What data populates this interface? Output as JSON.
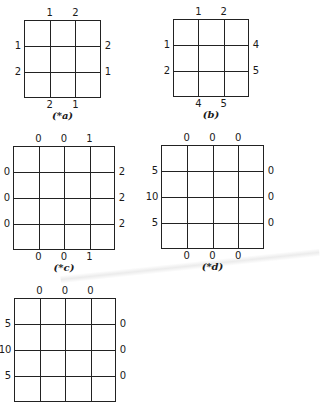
{
  "figures": [
    {
      "id": "a",
      "caption": "(*a)",
      "box": {
        "left": 24,
        "top": 20,
        "width": 77,
        "height": 78
      },
      "cols": 3,
      "rows": 3,
      "top_labels": [
        "1",
        "2"
      ],
      "bottom_labels": [
        "2",
        "1"
      ],
      "left_labels": [
        "1",
        "2"
      ],
      "right_labels": [
        "2",
        "1"
      ]
    },
    {
      "id": "b",
      "caption": "(b)",
      "box": {
        "left": 173,
        "top": 19,
        "width": 76,
        "height": 78
      },
      "cols": 3,
      "rows": 3,
      "top_labels": [
        "1",
        "2"
      ],
      "bottom_labels": [
        "4",
        "5"
      ],
      "left_labels": [
        "1",
        "2"
      ],
      "right_labels": [
        "4",
        "5"
      ]
    },
    {
      "id": "c",
      "caption": "(*c)",
      "box": {
        "left": 13,
        "top": 146,
        "width": 102,
        "height": 104
      },
      "cols": 4,
      "rows": 4,
      "top_labels": [
        "0",
        "0",
        "1"
      ],
      "bottom_labels": [
        "0",
        "0",
        "1"
      ],
      "left_labels": [
        "0",
        "0",
        "0"
      ],
      "right_labels": [
        "2",
        "2",
        "2"
      ]
    },
    {
      "id": "d",
      "caption": "(*d)",
      "box": {
        "left": 161,
        "top": 145,
        "width": 103,
        "height": 104
      },
      "cols": 4,
      "rows": 4,
      "top_labels": [
        "0",
        "0",
        "0"
      ],
      "bottom_labels": [
        "0",
        "0",
        "0"
      ],
      "left_labels": [
        "5",
        "10",
        "5"
      ],
      "right_labels": [
        "0",
        "0",
        "0"
      ]
    },
    {
      "id": "e",
      "caption": "",
      "box": {
        "left": 14,
        "top": 298,
        "width": 102,
        "height": 104
      },
      "cols": 4,
      "rows": 4,
      "top_labels": [
        "0",
        "0",
        "0"
      ],
      "bottom_labels": [],
      "left_labels": [
        "5",
        "10",
        "5"
      ],
      "right_labels": [
        "0",
        "0",
        "0"
      ]
    }
  ]
}
